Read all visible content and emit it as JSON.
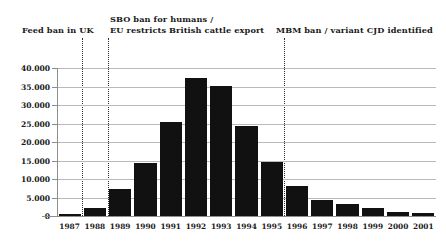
{
  "chart_data": {
    "type": "bar",
    "title": "",
    "xlabel": "",
    "ylabel": "",
    "categories": [
      "1987",
      "1988",
      "1989",
      "1990",
      "1991",
      "1992",
      "1993",
      "1994",
      "1995",
      "1996",
      "1997",
      "1998",
      "1999",
      "2000",
      "2001"
    ],
    "values": [
      450,
      2200,
      7200,
      14400,
      25300,
      37300,
      35100,
      24400,
      14500,
      8100,
      4400,
      3200,
      2300,
      1100,
      800
    ],
    "ylim": [
      0,
      40000
    ],
    "ytick_values": [
      0,
      5000,
      10000,
      15000,
      20000,
      25000,
      30000,
      35000,
      40000
    ],
    "ytick_labels": [
      "0",
      "5.000",
      "10.000",
      "15.000",
      "20.000",
      "25.000",
      "30.000",
      "35.000",
      "40.000"
    ],
    "grid": true,
    "legend": "none",
    "annotations": [
      {
        "label": "Feed ban in UK",
        "at_category": "1988",
        "line": true
      },
      {
        "label": "SBO ban for humans /\nEU restricts British cattle export",
        "at_category": "1989",
        "line": true
      },
      {
        "label": "MBM ban / variant CJD identified",
        "at_category": "1996",
        "line": true
      }
    ]
  },
  "annotations": {
    "feed_ban": "Feed ban in UK",
    "sbo_ban_line1": "SBO ban for humans /",
    "sbo_ban_line2": "EU restricts British cattle export",
    "mbm_ban": "MBM ban / variant CJD identified"
  }
}
